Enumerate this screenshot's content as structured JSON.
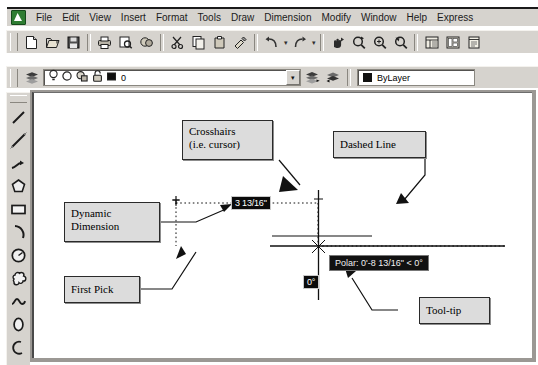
{
  "window": {
    "app_icon": "autocad-app-icon"
  },
  "menubar": {
    "items": [
      {
        "label": "File"
      },
      {
        "label": "Edit"
      },
      {
        "label": "View"
      },
      {
        "label": "Insert"
      },
      {
        "label": "Format"
      },
      {
        "label": "Tools"
      },
      {
        "label": "Draw"
      },
      {
        "label": "Dimension"
      },
      {
        "label": "Modify"
      },
      {
        "label": "Window"
      },
      {
        "label": "Help"
      },
      {
        "label": "Express"
      }
    ]
  },
  "standard_toolbar": {
    "buttons": [
      {
        "name": "new-icon",
        "title": "New"
      },
      {
        "name": "open-icon",
        "title": "Open"
      },
      {
        "name": "save-icon",
        "title": "Save"
      },
      {
        "name": "plot-icon",
        "title": "Plot"
      },
      {
        "name": "plot-preview-icon",
        "title": "Plot Preview"
      },
      {
        "name": "publish-icon",
        "title": "Publish"
      },
      {
        "name": "cut-icon",
        "title": "Cut"
      },
      {
        "name": "copy-icon",
        "title": "Copy"
      },
      {
        "name": "paste-icon",
        "title": "Paste"
      },
      {
        "name": "match-properties-icon",
        "title": "Match Properties"
      },
      {
        "name": "block-editor-icon",
        "title": "Block Editor"
      },
      {
        "name": "undo-icon",
        "title": "Undo"
      },
      {
        "name": "redo-icon",
        "title": "Redo"
      },
      {
        "name": "pan-realtime-icon",
        "title": "Pan Realtime"
      },
      {
        "name": "zoom-realtime-icon",
        "title": "Zoom Realtime"
      },
      {
        "name": "zoom-window-icon",
        "title": "Zoom Window"
      },
      {
        "name": "zoom-previous-icon",
        "title": "Zoom Previous"
      },
      {
        "name": "properties-icon",
        "title": "Properties"
      },
      {
        "name": "designcenter-icon",
        "title": "DesignCenter"
      },
      {
        "name": "tool-palettes-icon",
        "title": "Tool Palettes"
      }
    ]
  },
  "layer_toolbar": {
    "layer_manager_icon": "layer-properties-manager-icon",
    "state_icons": [
      {
        "name": "lightbulb-icon",
        "title": "On / Off"
      },
      {
        "name": "sun-icon",
        "title": "Freeze in all viewports"
      },
      {
        "name": "freeze-viewport-icon",
        "title": "Freeze in current viewport"
      },
      {
        "name": "lock-icon",
        "title": "Lock / Unlock"
      },
      {
        "name": "color-swatch-icon",
        "title": "Layer color"
      }
    ],
    "current_layer": "0",
    "dropdown_arrow": "chevron-down-icon",
    "make_layer_current_icon": "make-objects-layer-current-icon",
    "layer_previous_icon": "layer-previous-icon",
    "color_swatch": "#111111",
    "color_value": "ByLayer"
  },
  "draw_toolbar": {
    "tools": [
      {
        "name": "line-icon",
        "title": "Line"
      },
      {
        "name": "construction-line-icon",
        "title": "Construction Line"
      },
      {
        "name": "polyline-icon",
        "title": "Polyline"
      },
      {
        "name": "polygon-icon",
        "title": "Polygon"
      },
      {
        "name": "rectangle-icon",
        "title": "Rectangle"
      },
      {
        "name": "arc-icon",
        "title": "Arc"
      },
      {
        "name": "circle-icon",
        "title": "Circle"
      },
      {
        "name": "revision-cloud-icon",
        "title": "Revision Cloud"
      },
      {
        "name": "spline-icon",
        "title": "Spline"
      },
      {
        "name": "ellipse-icon",
        "title": "Ellipse"
      },
      {
        "name": "ellipse-arc-icon",
        "title": "Ellipse Arc"
      }
    ]
  },
  "canvas": {
    "dynamic_dimension_value": "3 13/16\"",
    "angle_value": "0°",
    "tooltip_text": "Polar: 0'-8 13/16\" < 0°",
    "crosshair_cursor": "crosshair-cursor",
    "first_pick_marker": "first-pick-point-marker"
  },
  "annotations": [
    {
      "id": "crosshairs",
      "label": "Crosshairs\n(i.e. cursor)",
      "line1": "Crosshairs",
      "line2": "(i.e. cursor)"
    },
    {
      "id": "dashed-line",
      "line1": "Dashed Line",
      "line2": ""
    },
    {
      "id": "dynamic-dimension",
      "line1": "Dynamic",
      "line2": "Dimension"
    },
    {
      "id": "first-pick",
      "line1": "First Pick",
      "line2": ""
    },
    {
      "id": "tool-tip",
      "line1": "Tool-tip",
      "line2": ""
    }
  ]
}
